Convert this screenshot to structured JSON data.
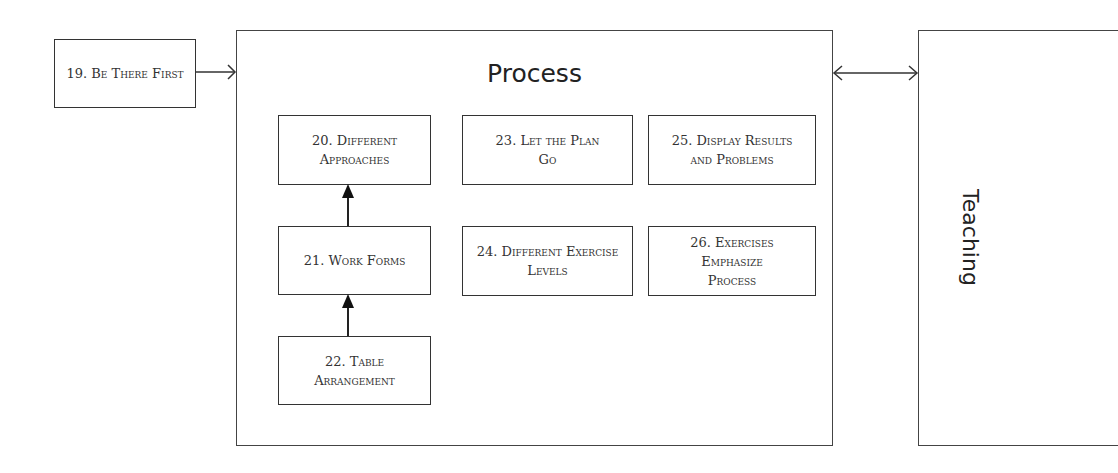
{
  "diagram": {
    "external_left": {
      "label": "19. Be There First"
    },
    "process": {
      "title": "Process",
      "nodes": [
        {
          "id": "20",
          "label": "20. Different Approaches"
        },
        {
          "id": "21",
          "label": "21. Work Forms"
        },
        {
          "id": "22",
          "label": "22. Table Arrangement"
        },
        {
          "id": "23",
          "label": "23. Let the Plan Go"
        },
        {
          "id": "24",
          "label": "24. Different Exercise Levels"
        },
        {
          "id": "25",
          "label": "25. Display Results and Problems"
        },
        {
          "id": "26",
          "label": "26. Exercises Emphasize Process"
        }
      ],
      "edges": [
        {
          "from": "22",
          "to": "21",
          "style": "filled-arrow"
        },
        {
          "from": "21",
          "to": "20",
          "style": "filled-arrow"
        }
      ]
    },
    "external_right": {
      "label": "Teaching"
    },
    "connections": [
      {
        "from": "19. Be There First",
        "to": "Process",
        "style": "open-arrow"
      },
      {
        "from": "Process",
        "to": "Teaching",
        "style": "bidirectional-open-arrow"
      }
    ]
  }
}
